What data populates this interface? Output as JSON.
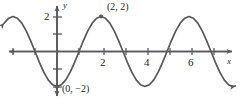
{
  "chart_data": {
    "type": "line",
    "title": "",
    "xlabel": "x",
    "ylabel": "y",
    "function": "y = -2cos(pi*x/2)",
    "amplitude": 2,
    "period": 4,
    "midline": 0,
    "xlim": [
      -2.4,
      8.2
    ],
    "ylim": [
      -2.9,
      2.9
    ],
    "grid": false,
    "legend": null,
    "x_ticks": [
      {
        "value": 2,
        "label": "2"
      },
      {
        "value": 4,
        "label": "4"
      },
      {
        "value": 6,
        "label": "6"
      }
    ],
    "x_ticks_unlabeled": [
      -2,
      -1,
      1,
      3,
      5,
      7
    ],
    "y_ticks": [
      {
        "value": 2,
        "label": "2"
      }
    ],
    "y_ticks_unlabeled": [
      1,
      -1,
      -2
    ],
    "annotations": [
      {
        "name": "maximum-point",
        "label": "(2, 2)",
        "x": 2,
        "y": 2
      },
      {
        "name": "minimum-point",
        "label": "(0, −2)",
        "x": 0,
        "y": -2
      }
    ],
    "points": [
      {
        "x": 0,
        "y": -2
      },
      {
        "x": 2,
        "y": 2
      }
    ],
    "series": [
      {
        "name": "cosine-curve",
        "color": "#58595b",
        "values": [
          {
            "x": -2.4,
            "y": 1.62
          },
          {
            "x": -2.2,
            "y": 1.9
          },
          {
            "x": -2.0,
            "y": 2.0
          },
          {
            "x": -1.8,
            "y": 1.9
          },
          {
            "x": -1.6,
            "y": 1.62
          },
          {
            "x": -1.4,
            "y": 1.18
          },
          {
            "x": -1.2,
            "y": 0.62
          },
          {
            "x": -1.0,
            "y": 0.0
          },
          {
            "x": -0.8,
            "y": -0.62
          },
          {
            "x": -0.6,
            "y": -1.18
          },
          {
            "x": -0.4,
            "y": -1.62
          },
          {
            "x": -0.2,
            "y": -1.9
          },
          {
            "x": 0.0,
            "y": -2.0
          },
          {
            "x": 0.2,
            "y": -1.9
          },
          {
            "x": 0.4,
            "y": -1.62
          },
          {
            "x": 0.6,
            "y": -1.18
          },
          {
            "x": 0.8,
            "y": -0.62
          },
          {
            "x": 1.0,
            "y": 0.0
          },
          {
            "x": 1.2,
            "y": 0.62
          },
          {
            "x": 1.4,
            "y": 1.18
          },
          {
            "x": 1.6,
            "y": 1.62
          },
          {
            "x": 1.8,
            "y": 1.9
          },
          {
            "x": 2.0,
            "y": 2.0
          },
          {
            "x": 2.2,
            "y": 1.9
          },
          {
            "x": 2.4,
            "y": 1.62
          },
          {
            "x": 2.6,
            "y": 1.18
          },
          {
            "x": 2.8,
            "y": 0.62
          },
          {
            "x": 3.0,
            "y": 0.0
          },
          {
            "x": 3.2,
            "y": -0.62
          },
          {
            "x": 3.4,
            "y": -1.18
          },
          {
            "x": 3.6,
            "y": -1.62
          },
          {
            "x": 3.8,
            "y": -1.9
          },
          {
            "x": 4.0,
            "y": -2.0
          },
          {
            "x": 4.2,
            "y": -1.9
          },
          {
            "x": 4.4,
            "y": -1.62
          },
          {
            "x": 4.6,
            "y": -1.18
          },
          {
            "x": 4.8,
            "y": -0.62
          },
          {
            "x": 5.0,
            "y": 0.0
          },
          {
            "x": 5.2,
            "y": 0.62
          },
          {
            "x": 5.4,
            "y": 1.18
          },
          {
            "x": 5.6,
            "y": 1.62
          },
          {
            "x": 5.8,
            "y": 1.9
          },
          {
            "x": 6.0,
            "y": 2.0
          },
          {
            "x": 6.2,
            "y": 1.9
          },
          {
            "x": 6.4,
            "y": 1.62
          },
          {
            "x": 6.6,
            "y": 1.18
          },
          {
            "x": 6.8,
            "y": 0.62
          },
          {
            "x": 7.0,
            "y": 0.0
          },
          {
            "x": 7.2,
            "y": -0.62
          },
          {
            "x": 7.4,
            "y": -1.18
          },
          {
            "x": 7.6,
            "y": -1.62
          },
          {
            "x": 7.8,
            "y": -1.9
          },
          {
            "x": 8.0,
            "y": -2.0
          },
          {
            "x": 8.1,
            "y": -1.97
          }
        ]
      }
    ],
    "colors": {
      "curve": "#58595b",
      "axis": "#58595b",
      "text": "#231f20",
      "background": "#ffffff"
    }
  }
}
